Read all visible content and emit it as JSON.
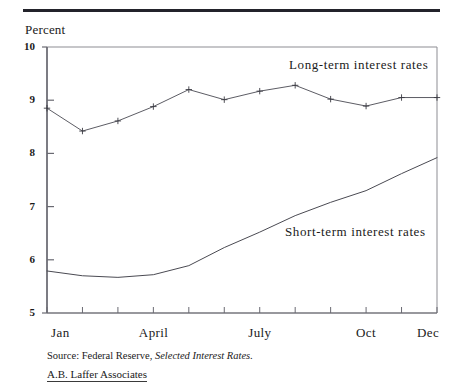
{
  "figure": {
    "y_axis_caption": "Percent",
    "source_prefix": "Source:",
    "source_agency": "Federal Reserve,",
    "source_publication": "Selected Interest Rates.",
    "credit": "A.B. Laffer Associates"
  },
  "chart_data": {
    "type": "line",
    "title": "",
    "subtitle": "",
    "xlabel": "",
    "ylabel": "Percent",
    "ylim": [
      5,
      10
    ],
    "xlim": [
      0,
      11
    ],
    "grid": false,
    "legend_position": "inline-annotation",
    "ytick_labels": [
      "10",
      "9",
      "8",
      "7",
      "6",
      "5"
    ],
    "ytick_values": [
      10,
      9,
      8,
      7,
      6,
      5
    ],
    "xtick_labels": [
      "Jan",
      "April",
      "July",
      "Oct",
      "Dec"
    ],
    "xtick_indices": [
      0,
      3,
      6,
      9,
      11
    ],
    "categories": [
      "Jan",
      "Feb",
      "Mar",
      "April",
      "May",
      "June",
      "July",
      "Aug",
      "Sep",
      "Oct",
      "Nov",
      "Dec"
    ],
    "series": [
      {
        "name": "Long-term interest rates",
        "markers": true,
        "values": [
          8.85,
          8.42,
          8.61,
          8.88,
          9.2,
          9.01,
          9.17,
          9.28,
          9.02,
          8.89,
          9.05,
          9.05
        ]
      },
      {
        "name": "Short-term interest rates",
        "markers": false,
        "values": [
          5.79,
          5.7,
          5.67,
          5.72,
          5.89,
          6.23,
          6.52,
          6.83,
          7.08,
          7.3,
          7.62,
          7.92
        ]
      }
    ],
    "annotations": [
      {
        "text": "Long-term interest rates",
        "x": 8.1,
        "y": 9.63
      },
      {
        "text": "Short-term interest rates",
        "x": 7.95,
        "y": 6.46
      }
    ]
  }
}
